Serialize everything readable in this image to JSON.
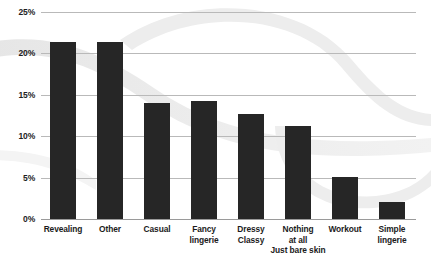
{
  "chart_data": {
    "type": "bar",
    "title": "",
    "subtitle": "",
    "xlabel": "",
    "ylabel": "",
    "categories": [
      "Revealing",
      "Other",
      "Casual",
      "Fancy lingerie",
      "Dressy Classy",
      "Nothing at all Just bare skin",
      "Workout",
      "Simple lingerie"
    ],
    "category_lines": [
      [
        "Revealing"
      ],
      [
        "Other"
      ],
      [
        "Casual"
      ],
      [
        "Fancy",
        "lingerie"
      ],
      [
        "Dressy",
        "Classy"
      ],
      [
        "Nothing",
        "at all",
        "Just bare skin"
      ],
      [
        "Workout"
      ],
      [
        "Simple",
        "lingerie"
      ]
    ],
    "values": [
      21,
      21,
      13.8,
      14,
      12.4,
      11,
      5,
      2
    ],
    "value_labels": [
      "21%",
      "21%",
      "13.8%",
      "14%",
      "12.4%",
      "11%",
      "5%",
      "2%"
    ],
    "ylim": [
      0,
      25
    ],
    "yticks": [
      0,
      5,
      10,
      15,
      20,
      25
    ],
    "ytick_labels": [
      "0%",
      "5%",
      "10%",
      "15%",
      "20%",
      "25%"
    ],
    "grid": true,
    "legend": false,
    "legend_position": "none",
    "bar_color": "#262626",
    "grid_color": "#b9b9b9",
    "background_color": "#ffffff",
    "decoration_color": "#ebebeb"
  }
}
